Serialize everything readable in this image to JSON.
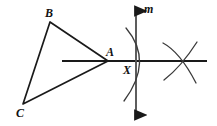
{
  "figure": {
    "background_color": "#ffffff",
    "stroke_color": "#1a1a1a",
    "width": 217,
    "height": 126,
    "labels": {
      "b": "B",
      "c": "C",
      "a": "A",
      "x": "X",
      "m": "m"
    },
    "elements": {
      "triangle": {
        "name": "triangle-abc",
        "vertices": [
          {
            "name": "B",
            "x": 50,
            "y": 22
          },
          {
            "name": "C",
            "x": 23,
            "y": 104
          },
          {
            "name": "A",
            "x": 108,
            "y": 61
          }
        ]
      },
      "horizontal_line": {
        "name": "horizontal-line",
        "x1": 62,
        "y1": 61,
        "x2": 207,
        "y2": 61
      },
      "vertical_line_m": {
        "name": "line-m",
        "x1": 136,
        "y1": 6,
        "x2": 136,
        "y2": 120,
        "arrow_top": true,
        "arrow_bottom": true
      },
      "point_x": {
        "name": "point-x",
        "x": 136,
        "y": 61
      },
      "arc_left": {
        "name": "construction-arc-left",
        "path": "M 126 28 Q 153 61 124 101"
      },
      "arc_right_upper": {
        "name": "construction-arc-right-upper",
        "path": "M 163 44 Q 182 53 196 82"
      },
      "arc_right_lower": {
        "name": "construction-arc-right-lower",
        "path": "M 197 43 Q 180 67 163 80"
      }
    }
  }
}
